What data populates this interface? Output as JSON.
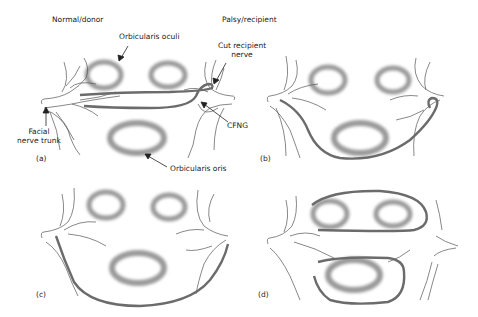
{
  "headers": {
    "left": "Normal/donor",
    "right": "Palsy/recipient"
  },
  "annotations": {
    "orbicularis_oculi": "Orbicularis oculi",
    "cut_recipient_nerve_line1": "Cut recipient",
    "cut_recipient_nerve_line2": "nerve",
    "facial_nerve_trunk_line1": "Facial",
    "facial_nerve_trunk_line2": "nerve trunk",
    "cfng": "CFNG",
    "orbicularis_oris": "Orbicularis oris"
  },
  "panels": [
    {
      "id": "a",
      "label": "(a)"
    },
    {
      "id": "b",
      "label": "(b)"
    },
    {
      "id": "c",
      "label": "(c)"
    },
    {
      "id": "d",
      "label": "(d)"
    }
  ],
  "colors": {
    "nerve_graft": "#6b6b6b",
    "nerve_branch": "#555555",
    "muscle": "#9a9a9a",
    "text": "#222222"
  }
}
